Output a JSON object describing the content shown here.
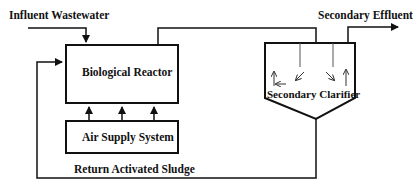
{
  "diagram": {
    "labels": {
      "influent": "Influent Wastewater",
      "effluent": "Secondary Effluent",
      "reactor": "Biological Reactor",
      "air": "Air Supply System",
      "clarifier": "Secondary Clarifier",
      "return_sludge": "Return Activated Sludge"
    },
    "colors": {
      "stroke": "#111111",
      "background": "#ffffff"
    }
  }
}
